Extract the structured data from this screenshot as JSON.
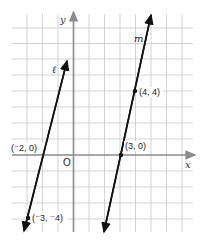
{
  "diagram": {
    "type": "coordinate-plane-lines",
    "axes": {
      "x_label": "x",
      "y_label": "y",
      "origin_label": "O",
      "x_range": [
        -4,
        7
      ],
      "y_range": [
        -5,
        8
      ],
      "grid": true
    },
    "lines": [
      {
        "name": "ℓ",
        "points": [
          {
            "x": -2,
            "y": 0,
            "label": "(⁻2, 0)"
          },
          {
            "x": -3,
            "y": -4,
            "label": "(⁻3, ⁻4)"
          }
        ]
      },
      {
        "name": "m",
        "points": [
          {
            "x": 4,
            "y": 4,
            "label": "(4, 4)"
          },
          {
            "x": 3,
            "y": 0,
            "label": "(3, 0)"
          }
        ]
      }
    ],
    "colors": {
      "grid": "#c8c8c8",
      "axes": "#8a8a8a",
      "lines": "#111111"
    }
  }
}
